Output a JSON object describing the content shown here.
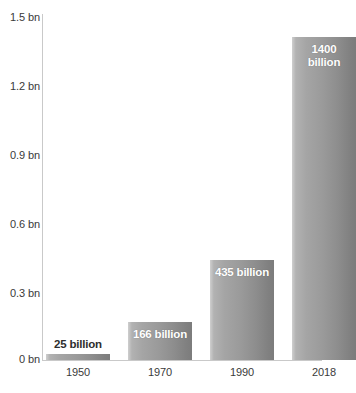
{
  "chart_data": {
    "type": "bar",
    "title": "",
    "subtitle": "",
    "xlabel": "",
    "ylabel": "",
    "categories": [
      "1950",
      "1970",
      "1990",
      "2018"
    ],
    "values": [
      25,
      166,
      435,
      1400
    ],
    "value_unit": "billion",
    "data_labels": [
      "25 billion",
      "166 billion",
      "435 billion",
      "1400 billion"
    ],
    "data_label_lines": [
      [
        "25 billion"
      ],
      [
        "166 billion"
      ],
      [
        "435 billion"
      ],
      [
        "1400",
        "billion"
      ]
    ],
    "data_label_placement": [
      "above-bar",
      "inside-bar",
      "inside-bar",
      "inside-bar"
    ],
    "y_tick_labels": [
      "1.5 bn",
      "1.2 bn",
      "0.9 bn",
      "0.6 bn",
      "0.3 bn",
      "0 bn"
    ],
    "y_tick_values": [
      1500,
      1200,
      900,
      600,
      300,
      0
    ],
    "ylim": [
      0,
      1500
    ],
    "grid": false,
    "legend": null,
    "legend_position": "none",
    "annotations": [],
    "colors": {
      "bar_gradient_light": "#cfcfcf",
      "bar_gradient_dark": "#7c7c7c",
      "axis_line": "#c9c9c9",
      "tick_label": "#3a3a3a",
      "inside_label_text": "#ffffff",
      "outside_label_text": "#2e2e2e",
      "background": "#ffffff"
    }
  }
}
